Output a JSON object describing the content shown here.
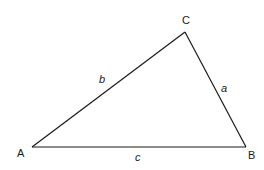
{
  "diagram": {
    "type": "triangle",
    "vertices": [
      {
        "id": "A",
        "label": "A",
        "x": 32,
        "y": 147
      },
      {
        "id": "B",
        "label": "B",
        "x": 246,
        "y": 147
      },
      {
        "id": "C",
        "label": "C",
        "x": 185,
        "y": 32
      }
    ],
    "sides": [
      {
        "id": "a",
        "label": "a",
        "from": "B",
        "to": "C"
      },
      {
        "id": "b",
        "label": "b",
        "from": "A",
        "to": "C"
      },
      {
        "id": "c",
        "label": "c",
        "from": "A",
        "to": "B"
      }
    ],
    "labels": {
      "A": "A",
      "B": "B",
      "C": "C",
      "a": "a",
      "b": "b",
      "c": "c"
    },
    "colors": {
      "stroke": "#1a1a1a",
      "background": "#ffffff"
    }
  }
}
